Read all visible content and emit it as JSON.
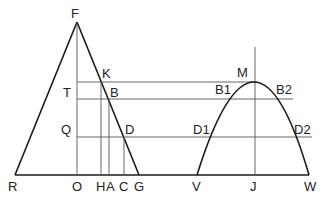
{
  "diagram": {
    "type": "geometry",
    "labels": {
      "F": "F",
      "K": "K",
      "T": "T",
      "B": "B",
      "Q": "Q",
      "D": "D",
      "R": "R",
      "O": "O",
      "H": "H",
      "A": "A",
      "C": "C",
      "G": "G",
      "M": "M",
      "B1": "B1",
      "B2": "B2",
      "D1": "D1",
      "D2": "D2",
      "V": "V",
      "J": "J",
      "W": "W"
    },
    "points": {
      "F": [
        77,
        22
      ],
      "R": [
        15,
        175
      ],
      "G": [
        139,
        175
      ],
      "O": [
        77,
        175
      ],
      "K": [
        101,
        82
      ],
      "B": [
        108,
        99
      ],
      "D": [
        124,
        137
      ],
      "H": [
        101,
        175
      ],
      "A": [
        109,
        175
      ],
      "C": [
        124,
        175
      ],
      "M": [
        255,
        82
      ],
      "B1": [
        219,
        99
      ],
      "B2": [
        293,
        99
      ],
      "D1": [
        203,
        137
      ],
      "D2": [
        312,
        137
      ],
      "V": [
        197,
        175
      ],
      "J": [
        255,
        175
      ],
      "W": [
        309,
        175
      ]
    },
    "colors": {
      "line": "#1a1a1a",
      "thin_line": "#555555",
      "background": "#ffffff"
    }
  }
}
